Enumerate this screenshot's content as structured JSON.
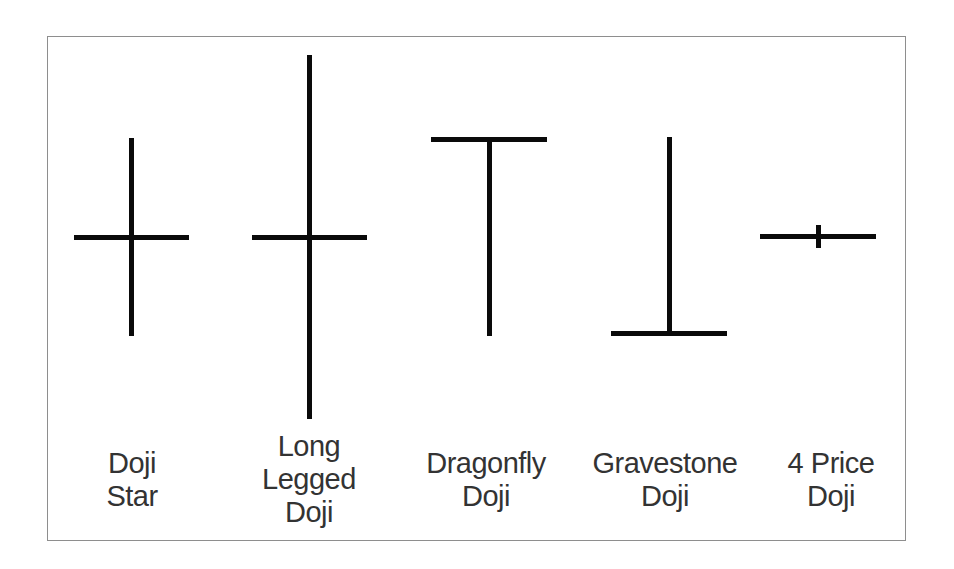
{
  "diagram": {
    "title": "",
    "colors": {
      "candle": "#0a0a0a",
      "text": "#333333",
      "border": "#8e8e8e",
      "background": "#ffffff"
    },
    "patterns": [
      {
        "id": "doji-star",
        "lines": [
          "Doji",
          "Star"
        ]
      },
      {
        "id": "long-legged-doji",
        "lines": [
          "Long",
          "Legged",
          "Doji"
        ]
      },
      {
        "id": "dragonfly-doji",
        "lines": [
          "Dragonfly",
          "Doji"
        ]
      },
      {
        "id": "gravestone-doji",
        "lines": [
          "Gravestone",
          "Doji"
        ]
      },
      {
        "id": "four-price-doji",
        "lines": [
          "4 Price",
          "Doji"
        ]
      }
    ]
  }
}
